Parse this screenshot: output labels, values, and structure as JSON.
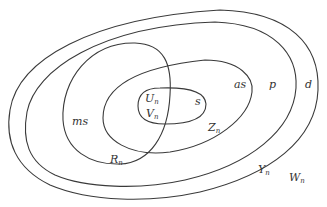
{
  "diagram": {
    "type": "nested set (Venn-like) diagram",
    "regions": [
      {
        "id": "outer",
        "set_label": "W",
        "set_subscript": "n",
        "region_label": "d"
      },
      {
        "id": "second",
        "set_label": "Y",
        "set_subscript": "n",
        "region_label": "p"
      },
      {
        "id": "left",
        "set_label": "R",
        "set_subscript": "n",
        "region_label": "ms"
      },
      {
        "id": "middle",
        "set_label": "Z",
        "set_subscript": "n",
        "region_label": "as"
      },
      {
        "id": "inner",
        "set_labels": [
          {
            "label": "U",
            "subscript": "n"
          },
          {
            "label": "V",
            "subscript": "n"
          }
        ],
        "region_label": "s"
      }
    ],
    "colors": {
      "stroke": "#3a3a3a",
      "text": "#333333",
      "background": "#ffffff"
    }
  },
  "labels": {
    "d": "d",
    "p": "p",
    "as": "as",
    "ms": "ms",
    "s": "s",
    "U": "U",
    "V": "V",
    "Z": "Z",
    "R": "R",
    "Y": "Y",
    "W": "W",
    "n": "n"
  }
}
